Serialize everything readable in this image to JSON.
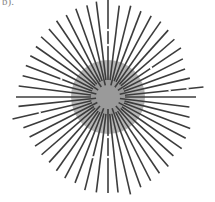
{
  "figure": {
    "panel_label": "b).",
    "center": [
      108,
      97
    ],
    "outer_disc": {
      "radius": 37,
      "color": "#a9a9a9"
    },
    "inner_disc": {
      "radius": 17,
      "color": "#9a9a9a"
    },
    "line_color": "#3c3c3c",
    "line_width": 1.6,
    "rays": [
      {
        "angle": -90,
        "r0": 17,
        "r1": 100
      },
      {
        "angle": -83,
        "r0": 17,
        "r1": 92
      },
      {
        "angle": -76,
        "r0": 12,
        "r1": 94
      },
      {
        "angle": -69,
        "r0": 17,
        "r1": 92
      },
      {
        "angle": -62,
        "r0": 17,
        "r1": 92
      },
      {
        "angle": -55,
        "r0": 12,
        "r1": 92
      },
      {
        "angle": -48,
        "r0": 17,
        "r1": 90
      },
      {
        "angle": -41,
        "r0": 17,
        "r1": 88
      },
      {
        "angle": -34,
        "r0": 12,
        "r1": 88
      },
      {
        "angle": -27,
        "r0": 17,
        "r1": 84
      },
      {
        "angle": -20,
        "r0": 17,
        "r1": 82
      },
      {
        "angle": -13,
        "r0": 12,
        "r1": 84
      },
      {
        "angle": -6,
        "r0": 17,
        "r1": 96
      },
      {
        "angle": 0,
        "r0": 17,
        "r1": 88
      },
      {
        "angle": 7,
        "r0": 12,
        "r1": 82
      },
      {
        "angle": 14,
        "r0": 17,
        "r1": 84
      },
      {
        "angle": 21,
        "r0": 17,
        "r1": 88
      },
      {
        "angle": 28,
        "r0": 12,
        "r1": 88
      },
      {
        "angle": 35,
        "r0": 17,
        "r1": 90
      },
      {
        "angle": 42,
        "r0": 17,
        "r1": 88
      },
      {
        "angle": 49,
        "r0": 12,
        "r1": 92
      },
      {
        "angle": 56,
        "r0": 17,
        "r1": 92
      },
      {
        "angle": 63,
        "r0": 17,
        "r1": 94
      },
      {
        "angle": 70,
        "r0": 12,
        "r1": 96
      },
      {
        "angle": 77,
        "r0": 17,
        "r1": 100
      },
      {
        "angle": 84,
        "r0": 17,
        "r1": 96
      },
      {
        "angle": 90,
        "r0": 12,
        "r1": 96
      },
      {
        "angle": 97,
        "r0": 17,
        "r1": 96
      },
      {
        "angle": 104,
        "r0": 17,
        "r1": 96
      },
      {
        "angle": 111,
        "r0": 12,
        "r1": 92
      },
      {
        "angle": 118,
        "r0": 17,
        "r1": 92
      },
      {
        "angle": 125,
        "r0": 17,
        "r1": 90
      },
      {
        "angle": 132,
        "r0": 12,
        "r1": 88
      },
      {
        "angle": 139,
        "r0": 17,
        "r1": 88
      },
      {
        "angle": 146,
        "r0": 17,
        "r1": 88
      },
      {
        "angle": 153,
        "r0": 12,
        "r1": 88
      },
      {
        "angle": 160,
        "r0": 17,
        "r1": 90
      },
      {
        "angle": 167,
        "r0": 17,
        "r1": 98
      },
      {
        "angle": 174,
        "r0": 12,
        "r1": 90
      },
      {
        "angle": 180,
        "r0": 17,
        "r1": 92
      },
      {
        "angle": 187,
        "r0": 17,
        "r1": 90
      },
      {
        "angle": 194,
        "r0": 12,
        "r1": 88
      },
      {
        "angle": 201,
        "r0": 17,
        "r1": 88
      },
      {
        "angle": 208,
        "r0": 17,
        "r1": 88
      },
      {
        "angle": 215,
        "r0": 12,
        "r1": 88
      },
      {
        "angle": 222,
        "r0": 17,
        "r1": 90
      },
      {
        "angle": 229,
        "r0": 17,
        "r1": 90
      },
      {
        "angle": 236,
        "r0": 12,
        "r1": 92
      },
      {
        "angle": 243,
        "r0": 17,
        "r1": 92
      },
      {
        "angle": 250,
        "r0": 17,
        "r1": 94
      },
      {
        "angle": 257,
        "r0": 12,
        "r1": 94
      },
      {
        "angle": 263,
        "r0": 17,
        "r1": 96
      }
    ],
    "gaps": [
      {
        "angle": -90,
        "r": 67
      },
      {
        "angle": -90,
        "r": 52
      },
      {
        "angle": -34,
        "r": 52
      },
      {
        "angle": -6,
        "r": 62
      },
      {
        "angle": -6,
        "r": 80
      },
      {
        "angle": 90,
        "r": 40
      },
      {
        "angle": 90,
        "r": 60
      },
      {
        "angle": 167,
        "r": 70
      },
      {
        "angle": 201,
        "r": 50
      },
      {
        "angle": 104,
        "r": 62
      }
    ]
  }
}
